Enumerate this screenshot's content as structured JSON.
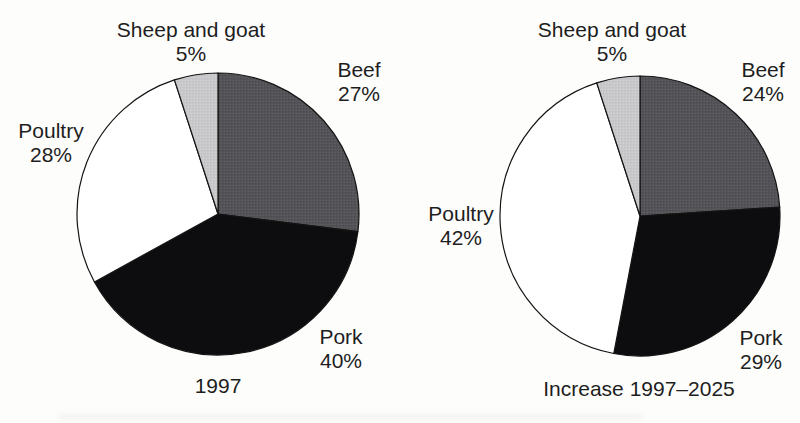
{
  "page": {
    "background": "#fdfdfc",
    "text_color": "#1e1e1e",
    "outline_color": "#141414"
  },
  "chart_data": [
    {
      "type": "pie",
      "title": "1997",
      "start_angle_deg": 0,
      "clockwise": true,
      "unit": "%",
      "categories": [
        "Beef",
        "Pork",
        "Poultry",
        "Sheep and goat"
      ],
      "values": [
        27,
        40,
        28,
        5
      ],
      "slice_styles": [
        {
          "fill": "#545458",
          "texture": "halftone-dark"
        },
        {
          "fill": "#0d0d0f",
          "texture": "solid"
        },
        {
          "fill": "#ffffff",
          "texture": "solid"
        },
        {
          "fill": "#c9c9cb",
          "texture": "halftone-light"
        }
      ],
      "layout": {
        "cx": 218,
        "cy": 214,
        "r": 141,
        "label_positions": [
          {
            "x": 359,
            "y": 58
          },
          {
            "x": 341,
            "y": 325
          },
          {
            "x": 51,
            "y": 119
          },
          {
            "x": 191,
            "y": 18
          }
        ]
      }
    },
    {
      "type": "pie",
      "title": "Increase 1997–2025",
      "start_angle_deg": 0,
      "clockwise": true,
      "unit": "%",
      "categories": [
        "Beef",
        "Pork",
        "Poultry",
        "Sheep and goat"
      ],
      "values": [
        24,
        29,
        42,
        5
      ],
      "slice_styles": [
        {
          "fill": "#545458",
          "texture": "halftone-dark"
        },
        {
          "fill": "#0d0d0f",
          "texture": "solid"
        },
        {
          "fill": "#ffffff",
          "texture": "solid"
        },
        {
          "fill": "#c9c9cb",
          "texture": "halftone-light"
        }
      ],
      "layout": {
        "cx": 640,
        "cy": 216,
        "r": 140,
        "label_positions": [
          {
            "x": 763,
            "y": 58
          },
          {
            "x": 761,
            "y": 326
          },
          {
            "x": 461,
            "y": 202
          },
          {
            "x": 612,
            "y": 18
          }
        ]
      }
    }
  ]
}
